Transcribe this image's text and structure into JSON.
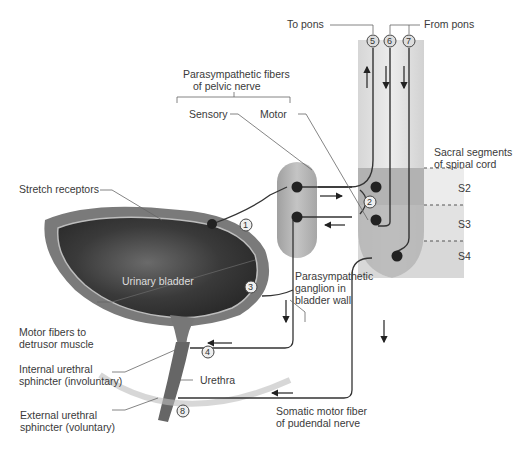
{
  "diagram": {
    "labels": {
      "to_pons": "To pons",
      "from_pons": "From pons",
      "parasympathetic_title_1": "Parasympathetic fibers",
      "parasympathetic_title_2": "of pelvic nerve",
      "sensory": "Sensory",
      "motor": "Motor",
      "sacral_1": "Sacral segments",
      "sacral_2": "of spinal cord",
      "s2": "S2",
      "s3": "S3",
      "s4": "S4",
      "stretch_receptors": "Stretch receptors",
      "urinary_bladder": "Urinary bladder",
      "ganglion_1": "Parasympathetic",
      "ganglion_2": "ganglion in",
      "ganglion_3": "bladder wall",
      "motor_fibers_1": "Motor fibers to",
      "motor_fibers_2": "detrusor muscle",
      "internal_1": "Internal urethral",
      "internal_2": "sphincter (involuntary)",
      "urethra": "Urethra",
      "external_1": "External urethral",
      "external_2": "sphincter (voluntary)",
      "somatic_1": "Somatic motor fiber",
      "somatic_2": "of pudendal nerve"
    },
    "steps": [
      "1",
      "2",
      "3",
      "4",
      "5",
      "6",
      "7",
      "8"
    ],
    "colors": {
      "cord_light": "#e4e4e4",
      "cord_mid": "#c9c9c9",
      "cord_dark": "#a8a8a8",
      "ganglion": "#b0b0b0",
      "neuron": "#2a2a2a",
      "bladder_dark": "#3c3c3c",
      "bladder_wall": "#8a8a8a"
    }
  }
}
